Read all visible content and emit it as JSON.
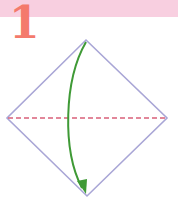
{
  "step": {
    "number": "1"
  },
  "colors": {
    "header_band": "#f8cfe0",
    "step_number": "#f47a6c",
    "paper_edge": "#a9a6d6",
    "valley_fold_line": "#d9607a",
    "fold_arrow": "#3f9a36"
  },
  "diagram": {
    "shape": "square-on-point",
    "fold_line": "horizontal-diagonal-dashed",
    "arrow": "fold-top-corner-down-to-bottom-corner"
  }
}
